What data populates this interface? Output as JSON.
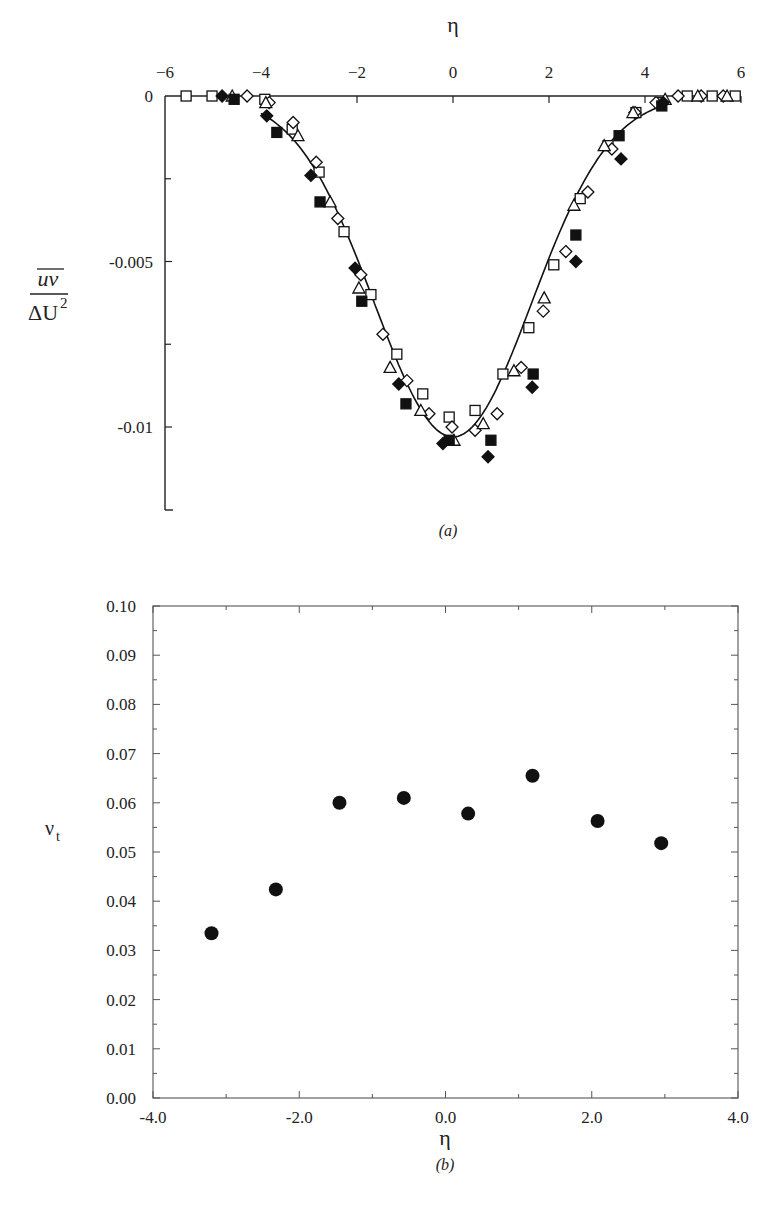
{
  "chart_data": [
    {
      "type": "scatter",
      "panel": "(a)",
      "caption": "a",
      "title": "",
      "xlabel": "η",
      "xlabel_position": "top",
      "ylabel_numerator": "uv",
      "ylabel_denominator": "ΔU",
      "ylabel_exponent": "2",
      "xlim": [
        -6,
        6
      ],
      "ylim": [
        -0.0125,
        0
      ],
      "x_ticks": [
        -6,
        -4,
        -2,
        0,
        2,
        4,
        6
      ],
      "x_tick_labels": [
        "−6",
        "−4",
        "−2",
        "0",
        "2",
        "4",
        "6"
      ],
      "y_ticks": [
        0,
        -0.005,
        -0.01
      ],
      "y_tick_labels": [
        "0",
        "-0.005",
        "-0.01"
      ],
      "y_minor_ticks": [
        -0.0025,
        -0.0075
      ],
      "grid": false,
      "legend": "none",
      "series": [
        {
          "name": "open-square",
          "marker": "square-open",
          "x": [
            -5.56,
            -5.02,
            -3.92,
            -3.35,
            -2.79,
            -2.27,
            -1.71,
            -1.17,
            -0.63,
            -0.08,
            0.46,
            1.04,
            1.58,
            2.1,
            2.65,
            3.23,
            3.81,
            4.31,
            4.88,
            5.4,
            5.88
          ],
          "y": [
            0,
            0,
            -0.0001,
            -0.001,
            -0.0023,
            -0.0041,
            -0.006,
            -0.0078,
            -0.009,
            -0.0097,
            -0.0095,
            -0.0084,
            -0.007,
            -0.0051,
            -0.0031,
            -0.0015,
            -0.0005,
            -0.0002,
            0,
            0,
            0
          ]
        },
        {
          "name": "open-diamond",
          "marker": "diamond-open",
          "x": [
            -4.29,
            -3.83,
            -3.33,
            -2.85,
            -2.4,
            -1.92,
            -1.46,
            -0.96,
            -0.5,
            -0.02,
            0.46,
            0.92,
            1.42,
            1.88,
            2.35,
            2.81,
            3.31,
            3.79,
            4.23,
            4.69,
            5.17,
            5.63
          ],
          "y": [
            0,
            -0.0002,
            -0.0008,
            -0.002,
            -0.0037,
            -0.0054,
            -0.0072,
            -0.0086,
            -0.0096,
            -0.01,
            -0.0101,
            -0.0096,
            -0.0082,
            -0.0065,
            -0.0047,
            -0.0029,
            -0.0016,
            -0.0005,
            -0.0002,
            0,
            0,
            0
          ]
        },
        {
          "name": "open-triangle",
          "marker": "triangle-open",
          "x": [
            -4.6,
            -3.9,
            -3.23,
            -2.56,
            -1.96,
            -1.31,
            -0.67,
            0.02,
            0.63,
            1.27,
            1.9,
            2.52,
            3.15,
            3.75,
            4.42,
            5.1,
            5.71
          ],
          "y": [
            0,
            -0.0002,
            -0.0012,
            -0.0032,
            -0.0058,
            -0.0082,
            -0.0095,
            -0.0104,
            -0.0099,
            -0.0083,
            -0.0061,
            -0.0033,
            -0.0015,
            -0.0005,
            -0.0001,
            0,
            0
          ]
        },
        {
          "name": "filled-square",
          "marker": "square-filled",
          "x": [
            -4.56,
            -3.67,
            -2.77,
            -1.9,
            -0.98,
            -0.08,
            0.79,
            1.67,
            2.56,
            3.46,
            4.35
          ],
          "y": [
            -0.0001,
            -0.0011,
            -0.0032,
            -0.0062,
            -0.0093,
            -0.0104,
            -0.0104,
            -0.0084,
            -0.0042,
            -0.0012,
            -0.0003
          ]
        },
        {
          "name": "filled-diamond",
          "marker": "diamond-filled",
          "x": [
            -4.81,
            -3.88,
            -2.96,
            -2.04,
            -1.13,
            -0.21,
            0.73,
            1.65,
            2.56,
            3.5,
            4.38
          ],
          "y": [
            0,
            -0.0006,
            -0.0024,
            -0.0052,
            -0.0087,
            -0.0105,
            -0.0109,
            -0.0088,
            -0.005,
            -0.0019,
            -0.0002
          ]
        }
      ],
      "fit_curve": {
        "name": "gaussian-fit",
        "type": "line",
        "form": "y = A * exp(-x^2 / (2 * s^2))",
        "A": -0.0103,
        "s": 1.64,
        "x_range": [
          -4,
          4.3
        ]
      }
    },
    {
      "type": "scatter",
      "panel": "(b)",
      "caption": "b",
      "title": "",
      "xlabel": "η",
      "ylabel": "ν",
      "ylabel_sub": "t",
      "xlim": [
        -4,
        4
      ],
      "ylim": [
        0,
        0.1
      ],
      "x_ticks": [
        -4,
        -2,
        0,
        2,
        4
      ],
      "x_tick_labels": [
        "-4.0",
        "-2.0",
        "0.0",
        "2.0",
        "4.0"
      ],
      "x_minor_ticks": [
        -3,
        -1,
        1,
        3
      ],
      "y_ticks": [
        0,
        0.01,
        0.02,
        0.03,
        0.04,
        0.05,
        0.06,
        0.07,
        0.08,
        0.09,
        0.1
      ],
      "y_tick_labels": [
        "0.00",
        "0.01",
        "0.02",
        "0.03",
        "0.04",
        "0.05",
        "0.06",
        "0.07",
        "0.08",
        "0.09",
        "0.10"
      ],
      "grid": false,
      "legend": "none",
      "series": [
        {
          "name": "nu_t",
          "marker": "circle-filled",
          "x": [
            -3.2,
            -2.32,
            -1.45,
            -0.57,
            0.31,
            1.19,
            2.08,
            2.95
          ],
          "y": [
            0.0335,
            0.0424,
            0.06,
            0.061,
            0.0578,
            0.0655,
            0.0563,
            0.0518
          ]
        }
      ]
    }
  ]
}
